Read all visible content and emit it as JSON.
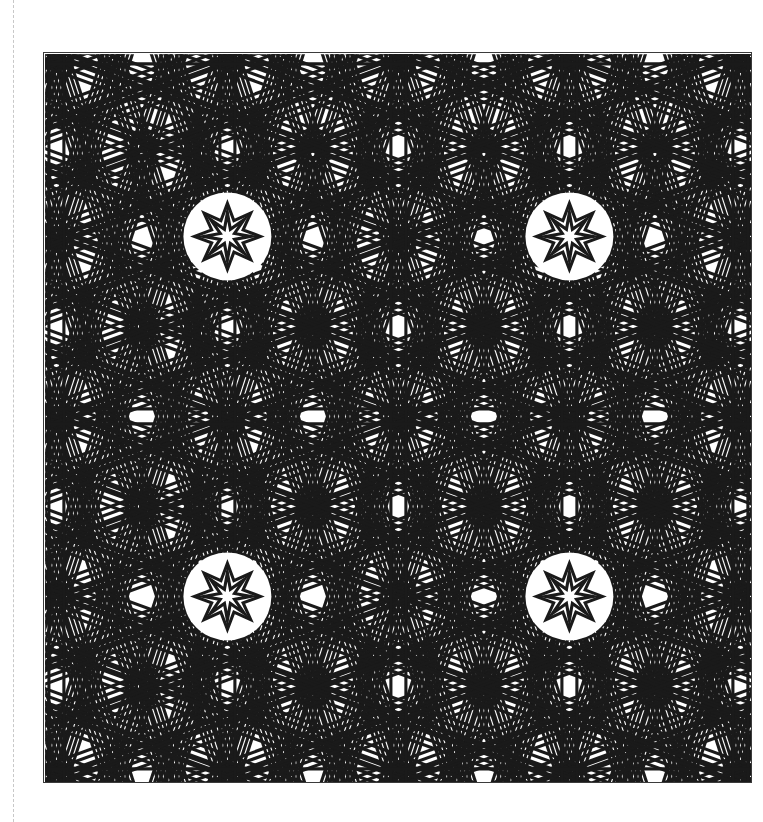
{
  "document": {
    "kind": "coloring-page",
    "page_width": 763,
    "page_height": 822,
    "background_color": "#ffffff",
    "margin_rule": {
      "name": "margin-rule",
      "x": 13,
      "style": "dashed",
      "color": "#c8c8c8"
    }
  },
  "artwork": {
    "title": "",
    "caption": "",
    "frame": {
      "x": 43,
      "y": 52,
      "width": 709,
      "height": 731,
      "stroke_color": "#3b3b3b",
      "stroke_width": 1.4,
      "fill_color": "#ffffff"
    },
    "style": {
      "line_color": "#1a1a1a",
      "line_width": 3.1,
      "strap_width": 15,
      "fill_color": "none"
    },
    "pattern": {
      "type": "islamic-strapwork-interlace",
      "symmetry": "8-fold star grid, mirrored",
      "cell_width": 342,
      "cell_height": 360,
      "origin_x": 226,
      "origin_y": 235,
      "star_points": 8,
      "rosette_outer_radius": 33,
      "rosette_inner_radius": 17,
      "rosette_centers": [
        {
          "x": 226,
          "y": 235
        },
        {
          "x": 568,
          "y": 235
        },
        {
          "x": 226,
          "y": 595
        },
        {
          "x": 568,
          "y": 595
        }
      ],
      "big_star_radius": 150,
      "center_node": {
        "x": 397,
        "y": 415
      }
    }
  }
}
